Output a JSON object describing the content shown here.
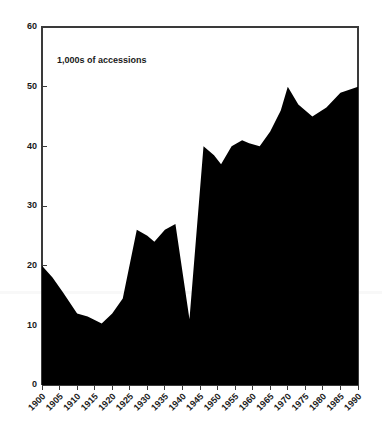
{
  "chart_data": {
    "type": "area",
    "title": "",
    "subtitle": "",
    "annotation": "1,000s of accessions",
    "xlabel": "",
    "ylabel": "",
    "ylim": [
      0,
      60
    ],
    "xlim": [
      1900,
      1990
    ],
    "yticks": [
      0,
      10,
      20,
      30,
      40,
      50,
      60
    ],
    "ytick_labels": [
      "0",
      "10",
      "20",
      "30",
      "40",
      "50",
      "60"
    ],
    "xticks": [
      1900,
      1905,
      1910,
      1915,
      1920,
      1925,
      1930,
      1935,
      1940,
      1945,
      1950,
      1955,
      1960,
      1965,
      1970,
      1975,
      1980,
      1985,
      1990
    ],
    "xtick_labels": [
      "1900",
      "1905",
      "1910",
      "1915",
      "1920",
      "1925",
      "1930",
      "1935",
      "1940",
      "1945",
      "1950",
      "1955",
      "1960",
      "1965",
      "1970",
      "1975",
      "1980",
      "1985",
      "1990"
    ],
    "xtick_rotation": 45,
    "grid": false,
    "legend": null,
    "fill_color": "#000000",
    "axis_color": "#3a3a3a",
    "background_color": "#ffffff",
    "x": [
      1900,
      1903,
      1906,
      1910,
      1913,
      1917,
      1920,
      1923,
      1927,
      1930,
      1932,
      1935,
      1938,
      1942,
      1946,
      1949,
      1951,
      1954,
      1957,
      1959,
      1962,
      1965,
      1968,
      1970,
      1973,
      1977,
      1981,
      1985,
      1990
    ],
    "values": [
      20,
      18,
      15.5,
      12,
      11.5,
      10.3,
      12,
      14.5,
      26,
      25,
      24,
      26,
      27,
      11,
      40,
      38.5,
      37,
      40,
      41,
      40.5,
      40,
      42.5,
      46,
      50,
      47,
      45,
      46.5,
      49,
      50
    ],
    "series": [
      {
        "name": "accessions",
        "values": [
          20,
          18,
          15.5,
          12,
          11.5,
          10.3,
          12,
          14.5,
          26,
          25,
          24,
          26,
          27,
          11,
          40,
          38.5,
          37,
          40,
          41,
          40.5,
          40,
          42.5,
          46,
          50,
          47,
          45,
          46.5,
          49,
          50
        ]
      }
    ]
  },
  "axes": {
    "y_axis_name": "y-axis",
    "x_axis_name": "x-axis"
  }
}
